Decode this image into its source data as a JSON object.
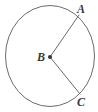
{
  "figure": {
    "kind": "circle-with-two-radii",
    "background_color": "#ffffff",
    "stroke_color": "#6b6b6b",
    "label_color": "#3a3a3a",
    "canvas": {
      "width": 98,
      "height": 112
    },
    "circle": {
      "center_x": 50,
      "center_y": 56,
      "radius_x": 44.5,
      "radius_y": 50.5,
      "stroke_width": 1
    },
    "center_point": {
      "label": "B",
      "x": 50,
      "y": 57,
      "dot_radius": 2.1,
      "label_x": 41,
      "label_y": 61
    },
    "points": [
      {
        "label": "A",
        "x": 79,
        "y": 15,
        "label_x": 77,
        "label_y": 13
      },
      {
        "label": "C",
        "x": 80,
        "y": 94,
        "label_x": 77,
        "label_y": 106
      }
    ],
    "segments": [
      {
        "name": "radius-BA",
        "from": "B",
        "to": "A",
        "x1": 50,
        "y1": 57,
        "x2": 79,
        "y2": 15
      },
      {
        "name": "radius-BC",
        "from": "B",
        "to": "C",
        "x1": 50,
        "y1": 57,
        "x2": 80,
        "y2": 94
      }
    ]
  }
}
